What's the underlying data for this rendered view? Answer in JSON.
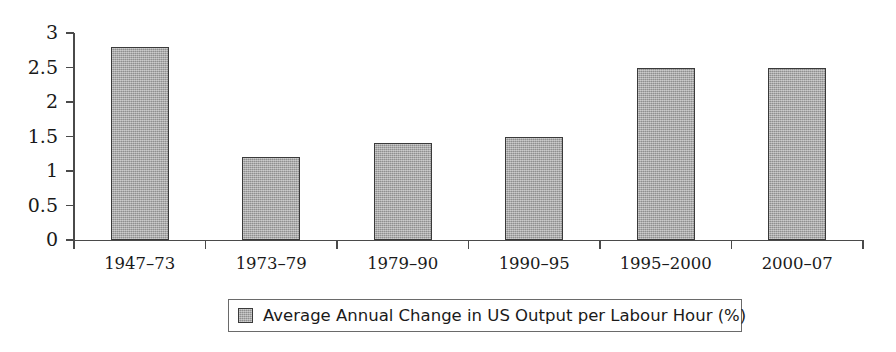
{
  "chart_data": {
    "type": "bar",
    "title": "",
    "subtitle": "",
    "xlabel": "",
    "ylabel": "",
    "categories": [
      "1947–73",
      "1973–79",
      "1979–90",
      "1990–95",
      "1995–2000",
      "2000–07"
    ],
    "values": [
      2.8,
      1.2,
      1.4,
      1.5,
      2.5,
      2.5
    ],
    "series": [
      {
        "name": "Average Annual Change in US Output per Labour Hour (%)",
        "values": [
          2.8,
          1.2,
          1.4,
          1.5,
          2.5,
          2.5
        ]
      }
    ],
    "ylim": [
      0,
      3
    ],
    "ytick_labels": [
      "3",
      "2.5",
      "2",
      "1.5",
      "1",
      "0.5",
      "0"
    ],
    "ytick_values": [
      3,
      2.5,
      2,
      1.5,
      1,
      0.5,
      0
    ],
    "grid": false,
    "legend_position": "bottom",
    "bar_color": "#a0a0a0",
    "bar_border_color": "#3a3a3a",
    "axis_color": "#4a4a4a",
    "background_color": "#ffffff"
  },
  "legend": {
    "label": "Average Annual Change in US Output per Labour Hour (%)",
    "swatch_name": "series-color-swatch"
  }
}
